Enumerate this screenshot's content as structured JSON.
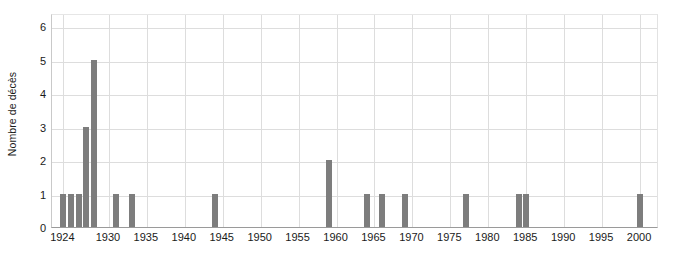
{
  "chart_data": {
    "type": "bar",
    "title": "",
    "subtitle": "",
    "xlabel": "",
    "ylabel": "Nombre de décès",
    "xlim": [
      1922.5,
      2002.5
    ],
    "ylim": [
      0,
      6.4
    ],
    "grid": true,
    "legend": null,
    "bar_color": "#7d7d7d",
    "grid_color": "#dddddd",
    "axis_color": "#9a9a9a",
    "y_ticks": [
      0,
      1,
      2,
      3,
      4,
      5,
      6
    ],
    "y_tick_labels": [
      "0",
      "1",
      "2",
      "3",
      "4",
      "5",
      "6"
    ],
    "x_ticks": [
      1924,
      1930,
      1935,
      1940,
      1945,
      1950,
      1955,
      1960,
      1965,
      1970,
      1975,
      1980,
      1985,
      1990,
      1995,
      2000
    ],
    "x_tick_labels": [
      "1924",
      "1930",
      "1935",
      "1940",
      "1945",
      "1950",
      "1955",
      "1960",
      "1965",
      "1970",
      "1975",
      "1980",
      "1985",
      "1990",
      "1995",
      "2000"
    ],
    "categories": [
      1924,
      1925,
      1926,
      1927,
      1928,
      1931,
      1933,
      1944,
      1959,
      1964,
      1966,
      1969,
      1977,
      1984,
      1985,
      2000
    ],
    "values": [
      1,
      1,
      1,
      3,
      5,
      1,
      1,
      1,
      2,
      1,
      1,
      1,
      1,
      1,
      1,
      1
    ],
    "bars": [
      {
        "x": 1924,
        "y": 1
      },
      {
        "x": 1925,
        "y": 1
      },
      {
        "x": 1926,
        "y": 1
      },
      {
        "x": 1927,
        "y": 3
      },
      {
        "x": 1928,
        "y": 5
      },
      {
        "x": 1931,
        "y": 1
      },
      {
        "x": 1933,
        "y": 1
      },
      {
        "x": 1944,
        "y": 1
      },
      {
        "x": 1959,
        "y": 2
      },
      {
        "x": 1964,
        "y": 1
      },
      {
        "x": 1966,
        "y": 1
      },
      {
        "x": 1969,
        "y": 1
      },
      {
        "x": 1977,
        "y": 1
      },
      {
        "x": 1984,
        "y": 1
      },
      {
        "x": 1985,
        "y": 1
      },
      {
        "x": 2000,
        "y": 1
      }
    ]
  }
}
